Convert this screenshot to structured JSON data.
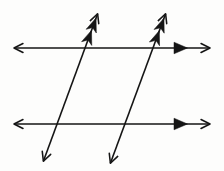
{
  "figure": {
    "width": 224,
    "height": 171,
    "background_color": "#fdfdfc",
    "stroke_color": "#151515",
    "line_width": 1.6
  },
  "chart_data": {
    "type": "diagram",
    "xlabel": "",
    "ylabel": "",
    "xlim": [
      0,
      224
    ],
    "ylim": [
      0,
      171
    ],
    "grid": false,
    "legend": "none",
    "elements": [
      {
        "name": "top-horizontal-line",
        "kind": "line",
        "x1": 10,
        "y1": 48,
        "x2": 214,
        "y2": 48,
        "arrow_start": true,
        "arrow_end": true,
        "tick_marks": 1,
        "tick_kind": "filled-triangle-right",
        "tick_positions": [
          180
        ]
      },
      {
        "name": "bottom-horizontal-line",
        "kind": "line",
        "x1": 10,
        "y1": 124,
        "x2": 214,
        "y2": 124,
        "arrow_start": true,
        "arrow_end": true,
        "tick_marks": 1,
        "tick_kind": "filled-triangle-right",
        "tick_positions": [
          180
        ]
      },
      {
        "name": "left-transversal",
        "kind": "line",
        "x1": 42,
        "y1": 165,
        "x2": 99,
        "y2": 10,
        "arrow_start": true,
        "arrow_end": true,
        "tick_marks": 2,
        "tick_kind": "filled-chevron-up",
        "tick_positions": [
          0.82,
          0.9
        ]
      },
      {
        "name": "right-transversal",
        "kind": "line",
        "x1": 109,
        "y1": 167,
        "x2": 167,
        "y2": 10,
        "arrow_start": true,
        "arrow_end": true,
        "tick_marks": 2,
        "tick_kind": "filled-chevron-up",
        "tick_positions": [
          0.82,
          0.9
        ]
      }
    ],
    "intersections": [
      {
        "name": "top-left-intersection",
        "x": 85,
        "y": 48
      },
      {
        "name": "top-right-intersection",
        "x": 152,
        "y": 48
      },
      {
        "name": "bottom-left-intersection",
        "x": 57,
        "y": 124
      },
      {
        "name": "bottom-right-intersection",
        "x": 124,
        "y": 124
      }
    ],
    "labels": [],
    "annotations": []
  }
}
